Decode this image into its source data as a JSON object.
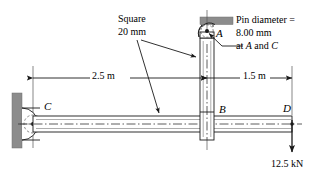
{
  "figure": {
    "type": "engineering-mechanics-diagram"
  },
  "annotations": {
    "square_label_line1": "Square",
    "square_label_line2": "20 mm",
    "pin_line1": "Pin diameter =",
    "pin_line2": "8.00 mm",
    "pin_line3_pre": "at ",
    "pin_line3_a": "A",
    "pin_line3_mid": " and ",
    "pin_line3_c": "C"
  },
  "dimensions": {
    "left_span": "2.5 m",
    "right_span": "1.5 m"
  },
  "points": {
    "a": "A",
    "b": "B",
    "c": "C",
    "d": "D"
  },
  "load": {
    "magnitude": "12.5 kN"
  },
  "colors": {
    "line": "#1a1a1a",
    "support_fill": "#8c8c8c",
    "member_fill": "#ffffff",
    "background": "#ffffff"
  },
  "geometry": {
    "vertical_member_x_center": 207,
    "point_b_x": 207,
    "point_c_x": 33,
    "point_d_x": 292,
    "beam_y_center": 124
  }
}
